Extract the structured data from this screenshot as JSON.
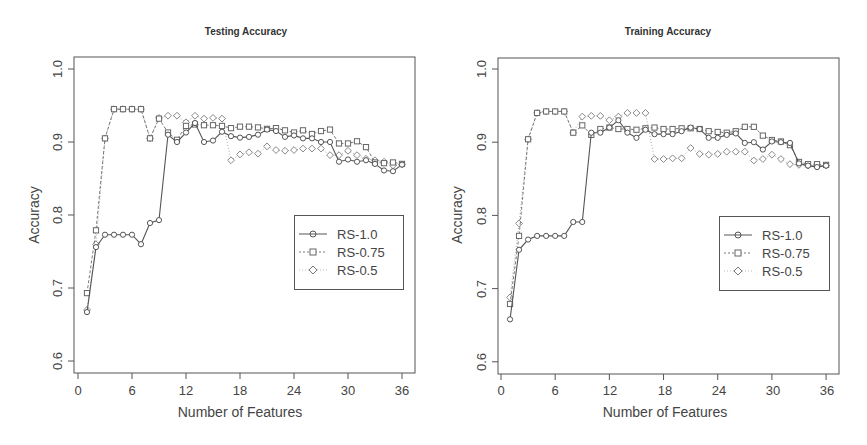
{
  "colors": {
    "series_1": "#555555",
    "series_2": "#777777",
    "series_3": "#999999",
    "axis": "#555555"
  },
  "chart_data": [
    {
      "type": "line",
      "title": "Testing Accuracy",
      "xlabel": "Number of Features",
      "ylabel": "Accuracy",
      "xlim": [
        0,
        36
      ],
      "ylim": [
        0.6,
        1.0
      ],
      "xticks": [
        "0",
        "6",
        "12",
        "18",
        "24",
        "30",
        "36"
      ],
      "yticks": [
        "0.6",
        "0.7",
        "0.8",
        "0.9",
        "1.0"
      ],
      "grid": false,
      "legend_position": "center-right",
      "x": [
        1,
        2,
        3,
        4,
        5,
        6,
        7,
        8,
        9,
        10,
        11,
        12,
        13,
        14,
        15,
        16,
        17,
        18,
        19,
        20,
        21,
        22,
        23,
        24,
        25,
        26,
        27,
        28,
        29,
        30,
        31,
        32,
        33,
        34,
        35,
        36
      ],
      "series": [
        {
          "name": "RS-1.0",
          "line": "solid",
          "marker": "circle",
          "values": [
            0.667,
            0.756,
            0.773,
            0.773,
            0.773,
            0.773,
            0.76,
            0.789,
            0.793,
            0.91,
            0.9,
            0.913,
            0.926,
            0.9,
            0.902,
            0.914,
            0.908,
            0.906,
            0.907,
            0.91,
            0.917,
            0.915,
            0.907,
            0.909,
            0.905,
            0.905,
            0.9,
            0.9,
            0.873,
            0.876,
            0.873,
            0.875,
            0.87,
            0.861,
            0.86,
            0.869
          ]
        },
        {
          "name": "RS-0.75",
          "line": "dashed",
          "marker": "square",
          "values": [
            0.693,
            0.779,
            0.905,
            0.945,
            0.945,
            0.945,
            0.945,
            0.905,
            0.932,
            0.913,
            0.903,
            0.922,
            0.924,
            0.923,
            0.923,
            0.922,
            0.919,
            0.921,
            0.921,
            0.92,
            0.918,
            0.919,
            0.916,
            0.913,
            0.916,
            0.911,
            0.915,
            0.917,
            0.898,
            0.898,
            0.901,
            0.893,
            0.872,
            0.871,
            0.872,
            0.87
          ]
        },
        {
          "name": "RS-0.5",
          "line": "dotted",
          "marker": "diamond",
          "values": [
            0.67,
            0.76,
            0.905,
            0.945,
            0.945,
            0.945,
            0.945,
            0.905,
            0.933,
            0.936,
            0.936,
            0.927,
            0.936,
            0.932,
            0.933,
            0.932,
            0.875,
            0.883,
            0.886,
            0.884,
            0.894,
            0.889,
            0.888,
            0.889,
            0.891,
            0.891,
            0.891,
            0.882,
            0.882,
            0.888,
            0.882,
            0.877,
            0.875,
            0.873,
            0.868,
            0.869
          ]
        }
      ]
    },
    {
      "type": "line",
      "title": "Training Accuracy",
      "xlabel": "Number of Features",
      "ylabel": "Accuracy",
      "xlim": [
        0,
        36
      ],
      "ylim": [
        0.6,
        1.0
      ],
      "xticks": [
        "0",
        "6",
        "12",
        "18",
        "24",
        "30",
        "36"
      ],
      "yticks": [
        "0.6",
        "0.7",
        "0.8",
        "0.9",
        "1.0"
      ],
      "grid": false,
      "legend_position": "center-right",
      "x": [
        1,
        2,
        3,
        4,
        5,
        6,
        7,
        8,
        9,
        10,
        11,
        12,
        13,
        14,
        15,
        16,
        17,
        18,
        19,
        20,
        21,
        22,
        23,
        24,
        25,
        26,
        27,
        28,
        29,
        30,
        31,
        32,
        33,
        34,
        35,
        36
      ],
      "series": [
        {
          "name": "RS-1.0",
          "line": "solid",
          "marker": "circle",
          "values": [
            0.658,
            0.753,
            0.767,
            0.772,
            0.772,
            0.772,
            0.772,
            0.791,
            0.791,
            0.913,
            0.913,
            0.92,
            0.93,
            0.913,
            0.906,
            0.917,
            0.911,
            0.911,
            0.911,
            0.915,
            0.92,
            0.918,
            0.906,
            0.906,
            0.91,
            0.912,
            0.899,
            0.9,
            0.89,
            0.901,
            0.9,
            0.899,
            0.871,
            0.868,
            0.866,
            0.868
          ]
        },
        {
          "name": "RS-0.75",
          "line": "dashed",
          "marker": "square",
          "values": [
            0.679,
            0.772,
            0.904,
            0.94,
            0.942,
            0.942,
            0.942,
            0.913,
            0.923,
            0.91,
            0.918,
            0.92,
            0.918,
            0.918,
            0.917,
            0.919,
            0.92,
            0.918,
            0.918,
            0.919,
            0.919,
            0.918,
            0.915,
            0.914,
            0.913,
            0.915,
            0.921,
            0.921,
            0.909,
            0.903,
            0.901,
            0.896,
            0.873,
            0.87,
            0.87,
            0.869
          ]
        },
        {
          "name": "RS-0.5",
          "line": "dotted",
          "marker": "diamond",
          "values": [
            0.688,
            0.789,
            0.904,
            0.94,
            0.942,
            0.942,
            0.942,
            0.913,
            0.935,
            0.936,
            0.936,
            0.93,
            0.935,
            0.94,
            0.94,
            0.94,
            0.877,
            0.877,
            0.878,
            0.878,
            0.892,
            0.884,
            0.883,
            0.884,
            0.887,
            0.887,
            0.887,
            0.875,
            0.877,
            0.883,
            0.877,
            0.87,
            0.869,
            0.868,
            0.868,
            0.868
          ]
        }
      ]
    }
  ]
}
